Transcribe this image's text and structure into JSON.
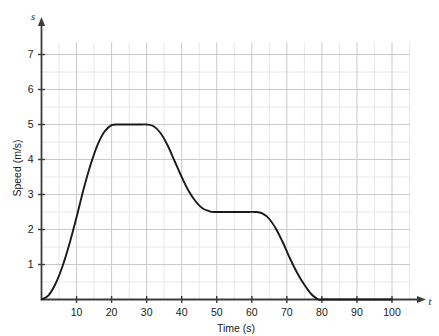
{
  "chart_data": {
    "type": "line",
    "title": "",
    "xlabel": "Time (s)",
    "ylabel": "Speed (m/s)",
    "x_axis_symbol": "t",
    "y_axis_symbol": "s",
    "xlim": [
      0,
      104
    ],
    "ylim": [
      0,
      7.35
    ],
    "grid": true,
    "grid_major_x_step": 10,
    "grid_minor_x_step": 5,
    "grid_major_y_step": 1,
    "grid_minor_y_step": 0.5,
    "legend": "none",
    "xticks": [
      10,
      20,
      30,
      40,
      50,
      60,
      70,
      80,
      90,
      100
    ],
    "xtick_labels": [
      "10",
      "20",
      "30",
      "40",
      "50",
      "60",
      "70",
      "80",
      "90",
      "100"
    ],
    "yticks": [
      1,
      2,
      3,
      4,
      5,
      6,
      7
    ],
    "ytick_labels": [
      "1",
      "2",
      "3",
      "4",
      "5",
      "6",
      "7"
    ],
    "series": [
      {
        "name": "speed",
        "color": "#1a1a1a",
        "x": [
          0,
          2,
          4,
          6,
          8,
          10,
          12,
          14,
          16,
          18,
          20,
          22,
          24,
          26,
          28,
          30,
          32,
          34,
          36,
          38,
          40,
          42,
          44,
          46,
          48,
          49,
          52,
          55,
          58,
          61,
          63,
          65,
          67,
          69,
          71,
          73,
          75,
          77,
          79,
          80,
          85,
          90,
          95,
          100
        ],
        "y": [
          0,
          0.12,
          0.45,
          0.95,
          1.6,
          2.35,
          3.15,
          3.85,
          4.42,
          4.8,
          4.98,
          5,
          5,
          5,
          5,
          5,
          4.95,
          4.75,
          4.4,
          3.95,
          3.5,
          3.1,
          2.8,
          2.6,
          2.52,
          2.5,
          2.5,
          2.5,
          2.5,
          2.5,
          2.46,
          2.3,
          2.0,
          1.6,
          1.15,
          0.75,
          0.42,
          0.15,
          0,
          0,
          0,
          0,
          0,
          0
        ]
      }
    ]
  },
  "axis": {
    "x_label": "Time (s)",
    "y_label": "Speed (m/s)",
    "x_symbol": "t",
    "y_symbol": "s"
  },
  "colors": {
    "curve": "#1a1a1a",
    "axis": "#3c3c3c",
    "grid_major": "#c9c9c9",
    "grid_minor": "#e8e8e8",
    "background": "#ffffff"
  }
}
